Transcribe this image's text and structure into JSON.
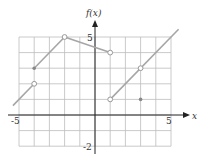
{
  "chart_data": {
    "type": "line",
    "title": "",
    "xlabel": "x",
    "ylabel": "f(x)",
    "xlim": [
      -5,
      5
    ],
    "ylim": [
      -2,
      5
    ],
    "grid": true,
    "x_tick_labels": [
      "-5",
      "5"
    ],
    "y_tick_labels": [
      "5",
      "-2"
    ],
    "series": [
      {
        "name": "segment-1",
        "points": [
          [
            -5.4,
            0.6
          ],
          [
            -4,
            2
          ]
        ],
        "end": "open"
      },
      {
        "name": "segment-2",
        "points": [
          [
            -4,
            3
          ],
          [
            -2,
            5
          ]
        ],
        "start": "closed",
        "end": "open"
      },
      {
        "name": "segment-3",
        "points": [
          [
            -2,
            5
          ],
          [
            1,
            4
          ]
        ],
        "end": "open"
      },
      {
        "name": "segment-4",
        "points": [
          [
            1,
            1
          ],
          [
            5.5,
            5.5
          ]
        ],
        "start": "open"
      }
    ],
    "isolated_points": [
      {
        "x": -4,
        "y": 3,
        "type": "closed"
      },
      {
        "x": 3,
        "y": 1,
        "type": "closed"
      }
    ],
    "open_points": [
      {
        "x": -4,
        "y": 2
      },
      {
        "x": -2,
        "y": 5
      },
      {
        "x": 1,
        "y": 4
      },
      {
        "x": 1,
        "y": 1
      },
      {
        "x": 3,
        "y": 3
      }
    ]
  },
  "labels": {
    "ylabel": "f(x)",
    "xlabel": "x",
    "x_min": "-5",
    "x_max": "5",
    "y_max": "5",
    "y_min": "-2"
  },
  "colors": {
    "grid": "#bdbdbd",
    "curve": "#a6a6a6",
    "axis": "#222222"
  }
}
